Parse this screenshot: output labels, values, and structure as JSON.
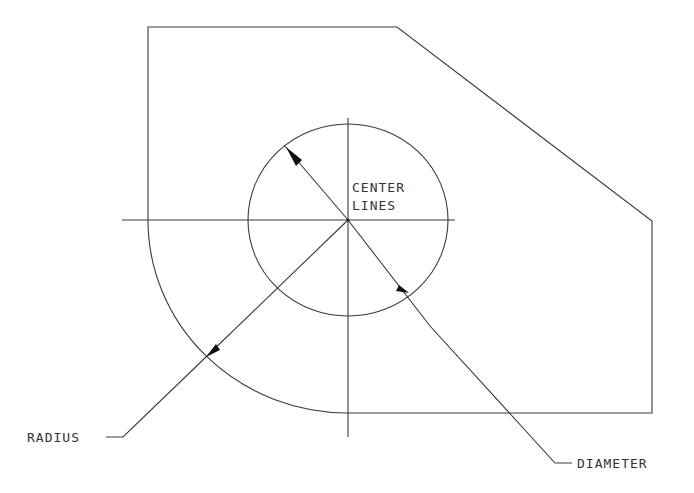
{
  "diagram": {
    "type": "mechanical drawing",
    "labels": {
      "center_lines_1": "CENTER",
      "center_lines_2": "LINES",
      "radius": "RADIUS",
      "diameter": "DIAMETER"
    },
    "colors": {
      "line": "#3a3a3a",
      "background": "#ffffff"
    }
  }
}
